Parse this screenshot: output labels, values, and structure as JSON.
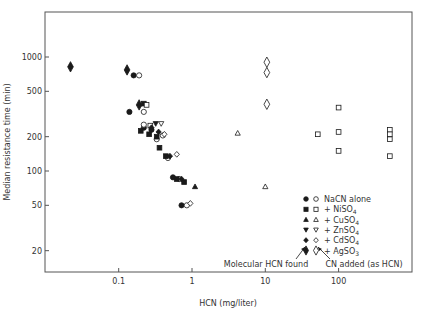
{
  "chart_data": {
    "type": "scatter",
    "title": "",
    "xlabel": "HCN  (mg/liter)",
    "ylabel": "Median resistance time  (min)",
    "xscale": "log",
    "yscale": "log",
    "xlim": [
      0.015,
      700
    ],
    "ylim": [
      10,
      2000
    ],
    "grid": false,
    "x_ticks": [
      {
        "value": 0.1,
        "label": "0.1"
      },
      {
        "value": 1,
        "label": "1"
      },
      {
        "value": 10,
        "label": "10"
      },
      {
        "value": 100,
        "label": "100"
      }
    ],
    "y_ticks": [
      {
        "value": 1000,
        "label": "1000"
      },
      {
        "value": 500,
        "label": "500"
      },
      {
        "value": 200,
        "label": "200"
      },
      {
        "value": 100,
        "label": "100"
      },
      {
        "value": 50,
        "label": "50"
      },
      {
        "value": 20,
        "label": "20"
      }
    ],
    "legend_position": "lower-right",
    "legend": [
      {
        "filled": "circle",
        "open": "circle",
        "label": "NaCN alone"
      },
      {
        "filled": "square",
        "open": "square",
        "label": "+ NiSO",
        "sub": "4"
      },
      {
        "filled": "triangle-up",
        "open": "triangle-up",
        "label": "+ CuSO",
        "sub": "4"
      },
      {
        "filled": "triangle-down",
        "open": "triangle-down",
        "label": "+ ZnSO",
        "sub": "4"
      },
      {
        "filled": "diamond",
        "open": "diamond",
        "label": "+ CdSO",
        "sub": "4"
      },
      {
        "filled": "tall-diamond",
        "open": "tall-diamond",
        "label": "+ AgSO",
        "sub": "3"
      }
    ],
    "annotations": [
      {
        "text": "Molecular HCN found",
        "refers_to": "filled symbols"
      },
      {
        "text": "CN added (as HCN)",
        "refers_to": "open symbols"
      }
    ],
    "series": [
      {
        "name": "NaCN alone — Molecular HCN found",
        "marker": "circle",
        "filled": true,
        "points": [
          [
            0.16,
            690
          ],
          [
            0.14,
            330
          ],
          [
            0.22,
            240
          ],
          [
            0.28,
            230
          ],
          [
            0.55,
            88
          ],
          [
            0.72,
            50
          ]
        ]
      },
      {
        "name": "NaCN alone — CN added",
        "marker": "circle",
        "filled": false,
        "points": [
          [
            0.19,
            690
          ],
          [
            0.22,
            330
          ],
          [
            0.22,
            255
          ],
          [
            0.33,
            190
          ],
          [
            0.4,
            205
          ],
          [
            0.47,
            130
          ],
          [
            0.67,
            85
          ],
          [
            0.85,
            50
          ]
        ]
      },
      {
        "name": "+ NiSO4 — Molecular HCN found",
        "marker": "square",
        "filled": true,
        "points": [
          [
            0.22,
            390
          ],
          [
            0.2,
            225
          ],
          [
            0.26,
            210
          ],
          [
            0.33,
            200
          ],
          [
            0.36,
            160
          ],
          [
            0.44,
            135
          ],
          [
            0.62,
            85
          ],
          [
            0.78,
            80
          ]
        ]
      },
      {
        "name": "+ NiSO4 — CN added",
        "marker": "square",
        "filled": false,
        "points": [
          [
            0.24,
            380
          ],
          [
            0.27,
            250
          ],
          [
            52,
            210
          ],
          [
            100,
            360
          ],
          [
            100,
            220
          ],
          [
            100,
            150
          ],
          [
            500,
            230
          ],
          [
            500,
            210
          ],
          [
            500,
            190
          ],
          [
            500,
            135
          ]
        ]
      },
      {
        "name": "+ CuSO4 — Molecular HCN found",
        "marker": "triangle-up",
        "filled": true,
        "points": [
          [
            1.1,
            73
          ]
        ]
      },
      {
        "name": "+ CuSO4 — CN added",
        "marker": "triangle-up",
        "filled": false,
        "points": [
          [
            4.2,
            215
          ],
          [
            10,
            73
          ]
        ]
      },
      {
        "name": "+ ZnSO4 — Molecular HCN found",
        "marker": "triangle-down",
        "filled": true,
        "points": [
          [
            0.32,
            260
          ]
        ]
      },
      {
        "name": "+ ZnSO4 — CN added",
        "marker": "triangle-down",
        "filled": false,
        "points": [
          [
            0.38,
            260
          ]
        ]
      },
      {
        "name": "+ CdSO4 — Molecular HCN found",
        "marker": "diamond",
        "filled": true,
        "points": [
          [
            0.28,
            240
          ],
          [
            0.35,
            220
          ],
          [
            0.5,
            135
          ],
          [
            0.72,
            85
          ]
        ]
      },
      {
        "name": "+ CdSO4 — CN added",
        "marker": "diamond",
        "filled": false,
        "points": [
          [
            0.42,
            210
          ],
          [
            0.62,
            140
          ],
          [
            0.95,
            52
          ]
        ]
      },
      {
        "name": "+ AgSO3 — Molecular HCN found",
        "marker": "tall-diamond",
        "filled": true,
        "points": [
          [
            0.022,
            820
          ],
          [
            0.13,
            770
          ],
          [
            0.19,
            380
          ]
        ]
      },
      {
        "name": "+ AgSO3 — CN added",
        "marker": "tall-diamond",
        "filled": false,
        "points": [
          [
            10.5,
            900
          ],
          [
            10.5,
            730
          ],
          [
            10.5,
            385
          ]
        ]
      }
    ]
  },
  "layout": {
    "frame": {
      "left": 45,
      "right": 412,
      "top": 12,
      "bottom": 272
    },
    "x_px": {
      "a": 192,
      "b": 73.3
    },
    "y_px": {
      "a": 171,
      "b": 114
    },
    "ink": "#1a1a1a",
    "frame_color": "#555555"
  }
}
